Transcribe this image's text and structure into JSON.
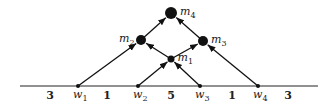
{
  "diagram": {
    "baseline": {
      "x1": 20,
      "x2": 318,
      "y": 86
    },
    "leaves": [
      {
        "id": "w1",
        "base": "w",
        "sub": "1",
        "x": 78,
        "y": 86
      },
      {
        "id": "w2",
        "base": "w",
        "sub": "2",
        "x": 138,
        "y": 86
      },
      {
        "id": "w3",
        "base": "w",
        "sub": "3",
        "x": 200,
        "y": 86
      },
      {
        "id": "w4",
        "base": "w",
        "sub": "4",
        "x": 258,
        "y": 86
      }
    ],
    "merge_nodes": [
      {
        "id": "m1",
        "base": "m",
        "sub": "1",
        "x": 171,
        "y": 59,
        "r": 3.5,
        "label_side": "right"
      },
      {
        "id": "m2",
        "base": "m",
        "sub": "2",
        "x": 141,
        "y": 40,
        "r": 5,
        "label_side": "left"
      },
      {
        "id": "m3",
        "base": "m",
        "sub": "3",
        "x": 203,
        "y": 41,
        "r": 5,
        "label_side": "right"
      },
      {
        "id": "m4",
        "base": "m",
        "sub": "4",
        "x": 171,
        "y": 13,
        "r": 6,
        "label_side": "right"
      }
    ],
    "edges": [
      {
        "from": "w2",
        "to": "m1"
      },
      {
        "from": "w3",
        "to": "m1"
      },
      {
        "from": "w1",
        "to": "m2"
      },
      {
        "from": "m1",
        "to": "m2"
      },
      {
        "from": "m1",
        "to": "m3"
      },
      {
        "from": "w4",
        "to": "m3"
      },
      {
        "from": "m2",
        "to": "m4"
      },
      {
        "from": "m3",
        "to": "m4"
      }
    ],
    "gap_weights": [
      {
        "value": "3",
        "x": 50
      },
      {
        "value": "1",
        "x": 107
      },
      {
        "value": "5",
        "x": 171
      },
      {
        "value": "1",
        "x": 232
      },
      {
        "value": "3",
        "x": 288
      }
    ]
  }
}
